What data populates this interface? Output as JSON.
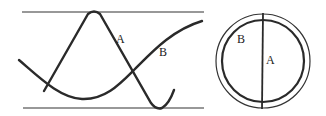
{
  "figure": {
    "wave_panel": {
      "curves": [
        {
          "id": "A",
          "label": "A",
          "description": "short-wavelength wave, larger amplitude reaching both boundaries"
        },
        {
          "id": "B",
          "label": "B",
          "description": "long-wavelength wave, smaller amplitude"
        }
      ],
      "boundaries": [
        "top-line",
        "bottom-line"
      ]
    },
    "circle_panel": {
      "labels": {
        "B": "B",
        "A": "A"
      },
      "parts": [
        "outer-ring",
        "inner-circle",
        "vertical-diameter"
      ]
    }
  }
}
